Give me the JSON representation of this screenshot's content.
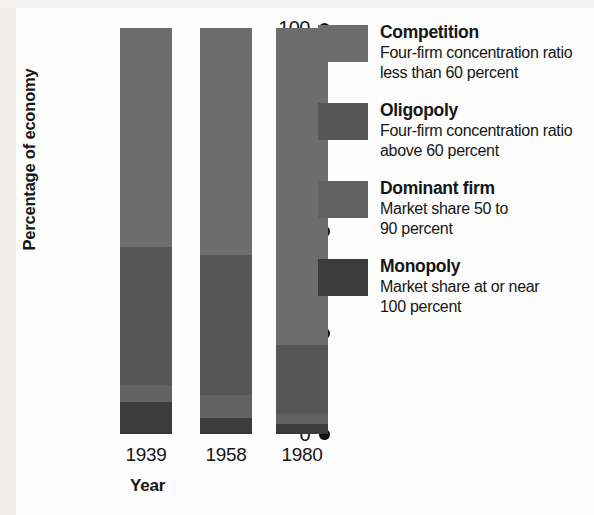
{
  "chart_data": {
    "type": "bar",
    "subtype": "stacked-bar-100",
    "title": "",
    "xlabel": "Year",
    "ylabel": "Percentage of economy",
    "categories": [
      "1939",
      "1958",
      "1980"
    ],
    "ylim": [
      0,
      100
    ],
    "yticks": [
      "0",
      "25",
      "50",
      "75",
      "100"
    ],
    "grid": false,
    "legend_position": "right",
    "stack_order_bottom_to_top": [
      "Monopoly",
      "Dominant firm",
      "Oligopoly",
      "Competition"
    ],
    "series": [
      {
        "name": "Competition",
        "values": [
          54,
          56,
          78
        ]
      },
      {
        "name": "Oligopoly",
        "values": [
          34,
          34.5,
          17
        ]
      },
      {
        "name": "Dominant firm",
        "values": [
          4,
          5.5,
          2.5
        ]
      },
      {
        "name": "Monopoly",
        "values": [
          8,
          4,
          2.5
        ]
      }
    ],
    "colors": {
      "Competition": "#6d6d6d",
      "Oligopoly": "#565656",
      "Dominant firm": "#626262",
      "Monopoly": "#3b3b3b"
    }
  },
  "axes": {
    "y": {
      "label": "Percentage of economy",
      "ticks": [
        {
          "value": 100,
          "label": "100"
        },
        {
          "value": 75,
          "label": "75"
        },
        {
          "value": 50,
          "label": "50"
        },
        {
          "value": 25,
          "label": "25"
        },
        {
          "value": 0,
          "label": "0"
        }
      ]
    },
    "x": {
      "label": "Year",
      "ticks": [
        {
          "label": "1939"
        },
        {
          "label": "1958"
        },
        {
          "label": "1980"
        }
      ]
    }
  },
  "legend": {
    "items": [
      {
        "title": "Competition",
        "desc": "Four-firm concentration ratio\nless than 60 percent",
        "color": "#6d6d6d"
      },
      {
        "title": "Oligopoly",
        "desc": "Four-firm concentration ratio\nabove 60 percent",
        "color": "#565656"
      },
      {
        "title": "Dominant firm",
        "desc": "Market share 50 to\n90 percent",
        "color": "#626262"
      },
      {
        "title": "Monopoly",
        "desc": "Market share at or near\n100 percent",
        "color": "#3b3b3b"
      }
    ]
  }
}
